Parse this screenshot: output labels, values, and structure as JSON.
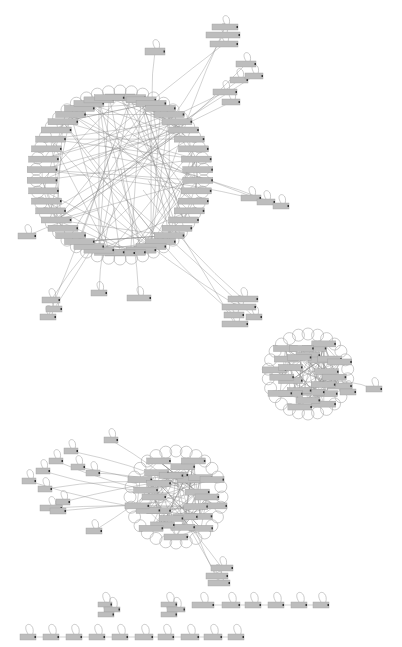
{
  "diagram": {
    "type": "network-graph",
    "background": "#ffffff",
    "node_color": "#bdbdbd",
    "edge_color": "#8a8a8a",
    "labels_legible": false,
    "clusters": [
      {
        "id": "main-ring",
        "kind": "ring",
        "cx": 120,
        "cy": 175,
        "r": 78,
        "nodes": 46,
        "node_w": 30,
        "node_h": 6,
        "dense_chords": 110,
        "self_loops": true
      },
      {
        "id": "cluster-right-mid",
        "kind": "disk",
        "cx": 308,
        "cy": 374,
        "r": 34,
        "nodes": 26,
        "node_w": 24,
        "node_h": 6,
        "dense_chords": 90,
        "self_loops": true
      },
      {
        "id": "cluster-bottom-hub",
        "kind": "disk",
        "cx": 176,
        "cy": 497,
        "r": 40,
        "nodes": 28,
        "node_w": 24,
        "node_h": 6,
        "dense_chords": 90,
        "self_loops": true
      }
    ],
    "satellites": [
      {
        "id": "sat-top-1",
        "x": 145,
        "y": 48,
        "w": 20,
        "h": 7,
        "link": "main-ring"
      },
      {
        "id": "sat-top-a",
        "x": 212,
        "y": 24,
        "w": 26,
        "h": 6,
        "link": "main-ring"
      },
      {
        "id": "sat-top-b",
        "x": 206,
        "y": 32,
        "w": 34,
        "h": 6,
        "link": "main-ring"
      },
      {
        "id": "sat-top-c",
        "x": 210,
        "y": 41,
        "w": 28,
        "h": 6,
        "link": "main-ring"
      },
      {
        "id": "sat-top-d",
        "x": 236,
        "y": 61,
        "w": 20,
        "h": 6,
        "link": "main-ring"
      },
      {
        "id": "sat-top-e",
        "x": 230,
        "y": 77,
        "w": 18,
        "h": 6,
        "link": "main-ring"
      },
      {
        "id": "sat-top-f",
        "x": 245,
        "y": 73,
        "w": 18,
        "h": 6,
        "link": "main-ring"
      },
      {
        "id": "sat-top-g",
        "x": 213,
        "y": 89,
        "w": 24,
        "h": 6,
        "link": "main-ring"
      },
      {
        "id": "sat-top-h",
        "x": 222,
        "y": 99,
        "w": 18,
        "h": 6,
        "link": "main-ring"
      },
      {
        "id": "sat-right-1",
        "x": 241,
        "y": 195,
        "w": 20,
        "h": 6,
        "link": "main-ring"
      },
      {
        "id": "sat-right-2",
        "x": 257,
        "y": 199,
        "w": 18,
        "h": 6,
        "link": "main-ring"
      },
      {
        "id": "sat-right-3",
        "x": 273,
        "y": 203,
        "w": 16,
        "h": 6,
        "link": "main-ring"
      },
      {
        "id": "sat-left-1",
        "x": 18,
        "y": 233,
        "w": 18,
        "h": 6,
        "link": "main-ring"
      },
      {
        "id": "sat-bl-1",
        "x": 42,
        "y": 297,
        "w": 18,
        "h": 6,
        "link": "main-ring"
      },
      {
        "id": "sat-bl-2",
        "x": 46,
        "y": 306,
        "w": 16,
        "h": 6,
        "link": "main-ring"
      },
      {
        "id": "sat-bl-3",
        "x": 40,
        "y": 314,
        "w": 16,
        "h": 6,
        "link": "main-ring"
      },
      {
        "id": "sat-bl-4",
        "x": 91,
        "y": 290,
        "w": 16,
        "h": 6,
        "link": "main-ring"
      },
      {
        "id": "sat-bm-1",
        "x": 127,
        "y": 295,
        "w": 24,
        "h": 6,
        "link": "main-ring"
      },
      {
        "id": "sat-br-1",
        "x": 228,
        "y": 296,
        "w": 30,
        "h": 6,
        "link": "main-ring"
      },
      {
        "id": "sat-br-2",
        "x": 222,
        "y": 304,
        "w": 34,
        "h": 6,
        "link": "main-ring"
      },
      {
        "id": "sat-br-3",
        "x": 224,
        "y": 312,
        "w": 20,
        "h": 6,
        "link": "main-ring"
      },
      {
        "id": "sat-br-4",
        "x": 246,
        "y": 314,
        "w": 16,
        "h": 6,
        "link": "main-ring"
      },
      {
        "id": "sat-br-5",
        "x": 222,
        "y": 321,
        "w": 26,
        "h": 6,
        "link": "main-ring"
      },
      {
        "id": "sat-rm-1",
        "x": 340,
        "y": 389,
        "w": 16,
        "h": 6,
        "link": "cluster-right-mid"
      },
      {
        "id": "sat-rm-2",
        "x": 366,
        "y": 386,
        "w": 16,
        "h": 6,
        "link": "cluster-right-mid"
      },
      {
        "id": "sat-bh-1",
        "x": 104,
        "y": 437,
        "w": 14,
        "h": 6,
        "link": "cluster-bottom-hub"
      },
      {
        "id": "sat-bh-2",
        "x": 64,
        "y": 448,
        "w": 14,
        "h": 6,
        "link": "cluster-bottom-hub"
      },
      {
        "id": "sat-bh-3",
        "x": 49,
        "y": 458,
        "w": 14,
        "h": 6,
        "link": "cluster-bottom-hub"
      },
      {
        "id": "sat-bh-4",
        "x": 71,
        "y": 464,
        "w": 14,
        "h": 6,
        "link": "cluster-bottom-hub"
      },
      {
        "id": "sat-bh-5",
        "x": 86,
        "y": 470,
        "w": 14,
        "h": 6,
        "link": "cluster-bottom-hub"
      },
      {
        "id": "sat-bh-6",
        "x": 36,
        "y": 468,
        "w": 14,
        "h": 6,
        "link": "cluster-bottom-hub"
      },
      {
        "id": "sat-bh-7",
        "x": 22,
        "y": 478,
        "w": 14,
        "h": 6,
        "link": "cluster-bottom-hub"
      },
      {
        "id": "sat-bh-8",
        "x": 38,
        "y": 486,
        "w": 14,
        "h": 6,
        "link": "cluster-bottom-hub"
      },
      {
        "id": "sat-bh-9",
        "x": 56,
        "y": 499,
        "w": 14,
        "h": 6,
        "link": "cluster-bottom-hub"
      },
      {
        "id": "sat-bh-10",
        "x": 40,
        "y": 505,
        "w": 22,
        "h": 6,
        "link": "cluster-bottom-hub"
      },
      {
        "id": "sat-bh-11",
        "x": 50,
        "y": 508,
        "w": 16,
        "h": 6,
        "link": "cluster-bottom-hub"
      },
      {
        "id": "sat-bh-12",
        "x": 86,
        "y": 528,
        "w": 16,
        "h": 6,
        "link": "cluster-bottom-hub"
      },
      {
        "id": "sat-bh-13",
        "x": 211,
        "y": 565,
        "w": 22,
        "h": 6,
        "link": "cluster-bottom-hub"
      },
      {
        "id": "sat-bh-14",
        "x": 206,
        "y": 573,
        "w": 22,
        "h": 6,
        "link": "cluster-bottom-hub"
      },
      {
        "id": "sat-bh-15",
        "x": 208,
        "y": 580,
        "w": 22,
        "h": 6,
        "link": "cluster-bottom-hub"
      }
    ],
    "chains": [
      {
        "id": "chain-mini-1",
        "nodes": [
          {
            "x": 98,
            "y": 602,
            "w": 14,
            "h": 5
          },
          {
            "x": 104,
            "y": 607,
            "w": 16,
            "h": 5
          },
          {
            "x": 98,
            "y": 612,
            "w": 16,
            "h": 5
          }
        ],
        "linked": false
      },
      {
        "id": "chain-mini-2",
        "nodes": [
          {
            "x": 161,
            "y": 602,
            "w": 16,
            "h": 5
          },
          {
            "x": 167,
            "y": 607,
            "w": 18,
            "h": 5
          },
          {
            "x": 161,
            "y": 612,
            "w": 16,
            "h": 5
          }
        ],
        "linked": false
      },
      {
        "id": "chain-row-1",
        "nodes": [
          {
            "x": 192,
            "y": 602,
            "w": 22,
            "h": 6
          },
          {
            "x": 222,
            "y": 602,
            "w": 18,
            "h": 6
          },
          {
            "x": 245,
            "y": 602,
            "w": 16,
            "h": 6
          },
          {
            "x": 268,
            "y": 602,
            "w": 16,
            "h": 6
          },
          {
            "x": 291,
            "y": 602,
            "w": 16,
            "h": 6
          },
          {
            "x": 313,
            "y": 602,
            "w": 16,
            "h": 6
          }
        ],
        "linked": true
      },
      {
        "id": "chain-row-2",
        "nodes": [
          {
            "x": 20,
            "y": 634,
            "w": 16,
            "h": 6
          },
          {
            "x": 43,
            "y": 634,
            "w": 16,
            "h": 6
          },
          {
            "x": 66,
            "y": 634,
            "w": 16,
            "h": 6
          },
          {
            "x": 89,
            "y": 634,
            "w": 16,
            "h": 6
          },
          {
            "x": 112,
            "y": 634,
            "w": 16,
            "h": 6
          },
          {
            "x": 135,
            "y": 634,
            "w": 18,
            "h": 6
          },
          {
            "x": 158,
            "y": 634,
            "w": 16,
            "h": 6
          },
          {
            "x": 181,
            "y": 634,
            "w": 18,
            "h": 6
          },
          {
            "x": 204,
            "y": 634,
            "w": 18,
            "h": 6
          },
          {
            "x": 228,
            "y": 634,
            "w": 16,
            "h": 6
          }
        ],
        "linked": true
      }
    ]
  }
}
